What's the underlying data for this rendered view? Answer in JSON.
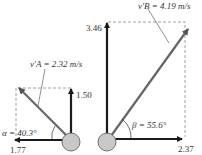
{
  "ball_a": {
    "velocity_label": "v′A = 2.32 m/s",
    "vertical_component": "1.50",
    "horizontal_component": "1.77",
    "angle_label": "α = 40.3°"
  },
  "ball_b": {
    "velocity_label": "v′B = 4.19 m/s",
    "vertical_component": "3.46",
    "horizontal_component": "2.37",
    "angle_label": "β = 55.6°"
  },
  "colors": {
    "arrow": "#1a1a1a",
    "resultant": "#555555",
    "ball_fill": "#c8c8c8",
    "dashed": "#777777"
  }
}
